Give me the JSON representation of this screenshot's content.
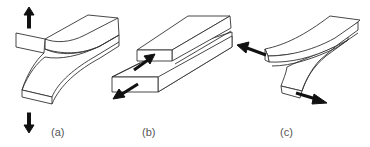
{
  "figure": {
    "panels": [
      {
        "id": "a",
        "label": "(a)",
        "mode": "opening",
        "arrows": [
          "arrow-up",
          "arrow-down"
        ]
      },
      {
        "id": "b",
        "label": "(b)",
        "mode": "in-plane sliding",
        "arrows": [
          "arrow-up-right",
          "arrow-down-left"
        ]
      },
      {
        "id": "c",
        "label": "(c)",
        "mode": "out-of-plane tearing",
        "arrows": [
          "arrow-left",
          "arrow-right"
        ]
      }
    ],
    "colors": {
      "stroke": "#333333",
      "arrow": "#111111",
      "label": "#555555",
      "background": "#ffffff"
    }
  }
}
